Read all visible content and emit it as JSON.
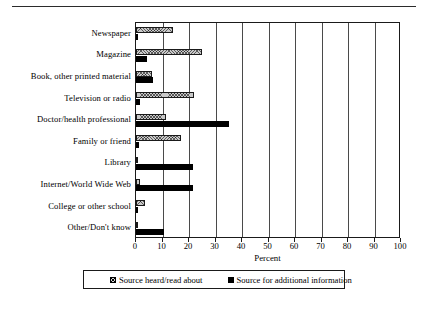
{
  "chart_data": {
    "type": "bar",
    "orientation": "horizontal",
    "title": "",
    "xlabel": "Percent",
    "ylabel": "",
    "xlim": [
      0,
      100
    ],
    "xticks": [
      0,
      10,
      20,
      30,
      40,
      50,
      60,
      70,
      80,
      90,
      100
    ],
    "grid": true,
    "legend_position": "bottom",
    "categories": [
      "Newspaper",
      "Magazine",
      "Book, other printed material",
      "Television or radio",
      "Doctor/health professional",
      "Family or friend",
      "Library",
      "Internet/World Wide Web",
      "College or other school",
      "Other/Don't know"
    ],
    "series": [
      {
        "name": "Source heard/read about",
        "style": "hatched",
        "color": "#c9c9c9",
        "values": [
          14,
          25,
          6,
          22,
          11.5,
          17,
          0.5,
          1.5,
          3.5,
          0.5
        ]
      },
      {
        "name": "Source for additional information",
        "style": "solid",
        "color": "#000000",
        "values": [
          0.5,
          4,
          6.5,
          1.5,
          35,
          1,
          21.5,
          21.5,
          0.5,
          10.5
        ]
      }
    ]
  },
  "axis": {
    "x_title": "Percent",
    "tick_labels": [
      "0",
      "10",
      "20",
      "30",
      "40",
      "50",
      "60",
      "70",
      "80",
      "90",
      "100"
    ]
  },
  "legend": {
    "entries": [
      {
        "label": "Source heard/read about",
        "swatch": "hatched-swatch"
      },
      {
        "label": "Source for additional information",
        "swatch": "solid-black-swatch"
      }
    ]
  }
}
